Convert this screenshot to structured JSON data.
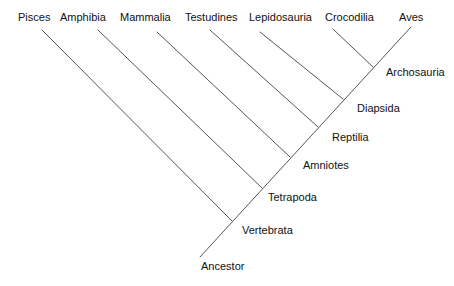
{
  "diagram": {
    "type": "cladogram",
    "line_color": "#555555",
    "trunk": {
      "x1": 200,
      "y1": 257,
      "x2": 411,
      "y2": 27
    },
    "taxa": [
      {
        "label": "Pisces",
        "label_x": 18,
        "label_y": 11,
        "tip_x": 42,
        "tip_y": 30,
        "join_x": 232,
        "join_y": 221
      },
      {
        "label": "Amphibia",
        "label_x": 60,
        "label_y": 11,
        "tip_x": 98,
        "tip_y": 30,
        "join_x": 262,
        "join_y": 188
      },
      {
        "label": "Mammalia",
        "label_x": 120,
        "label_y": 11,
        "tip_x": 157,
        "tip_y": 32,
        "join_x": 290,
        "join_y": 157
      },
      {
        "label": "Testudines",
        "label_x": 185,
        "label_y": 11,
        "tip_x": 210,
        "tip_y": 30,
        "join_x": 318,
        "join_y": 127
      },
      {
        "label": "Lepidosauria",
        "label_x": 249,
        "label_y": 11,
        "tip_x": 260,
        "tip_y": 32,
        "join_x": 343,
        "join_y": 99
      },
      {
        "label": "Crocodilia",
        "label_x": 325,
        "label_y": 11,
        "tip_x": 333,
        "tip_y": 29,
        "join_x": 373,
        "join_y": 67
      },
      {
        "label": "Aves",
        "label_x": 399,
        "label_y": 11,
        "tip_x": 411,
        "tip_y": 27,
        "join_x": 373,
        "join_y": 67
      }
    ],
    "clades": [
      {
        "label": "Archosauria",
        "x": 386,
        "y": 66
      },
      {
        "label": "Diapsida",
        "x": 357,
        "y": 102
      },
      {
        "label": "Reptilia",
        "x": 332,
        "y": 131
      },
      {
        "label": "Amniotes",
        "x": 303,
        "y": 159
      },
      {
        "label": "Tetrapoda",
        "x": 268,
        "y": 191
      },
      {
        "label": "Vertebrata",
        "x": 242,
        "y": 224
      },
      {
        "label": "Ancestor",
        "x": 201,
        "y": 260
      }
    ]
  }
}
